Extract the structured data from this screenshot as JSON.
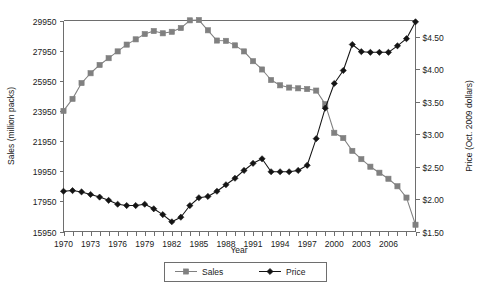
{
  "chart_data": {
    "type": "line",
    "title": "",
    "xlabel": "Year",
    "ylabel": "Sales (million packs)",
    "y2label": "Price (Oct. 2009 dollars)",
    "grid": false,
    "legend_position": "bottom-center",
    "xlim": [
      1970,
      2009
    ],
    "xticks": [
      1970,
      1973,
      1976,
      1979,
      1982,
      1985,
      1988,
      1991,
      1994,
      1997,
      2000,
      2003,
      2006
    ],
    "xtick_labels": [
      "1970",
      "1973",
      "1976",
      "1979",
      "1982",
      "1985",
      "1988",
      "1991",
      "1994",
      "1997",
      "2000",
      "2003",
      "2006"
    ],
    "x": [
      1970,
      1971,
      1972,
      1973,
      1974,
      1975,
      1976,
      1977,
      1978,
      1979,
      1980,
      1981,
      1982,
      1983,
      1984,
      1985,
      1986,
      1987,
      1988,
      1989,
      1990,
      1991,
      1992,
      1993,
      1994,
      1995,
      1996,
      1997,
      1998,
      1999,
      2000,
      2001,
      2002,
      2003,
      2004,
      2005,
      2006,
      2007,
      2008,
      2009
    ],
    "ylim": [
      15950,
      29950
    ],
    "yticks": [
      15950,
      17950,
      19950,
      21950,
      23950,
      25950,
      27950,
      29950
    ],
    "ytick_labels": [
      "15950",
      "17950",
      "19950",
      "21950",
      "23950",
      "25950",
      "27950",
      "29950"
    ],
    "y2lim": [
      1.5,
      4.75
    ],
    "y2ticks": [
      1.5,
      2.0,
      2.5,
      3.0,
      3.5,
      4.0,
      4.5
    ],
    "y2tick_labels": [
      "$1.50",
      "$2.00",
      "$2.50",
      "$3.00",
      "$3.50",
      "$4.00",
      "$4.50"
    ],
    "series": [
      {
        "name": "Sales",
        "axis": "left",
        "color": "#808080",
        "marker": "square",
        "values": [
          23950,
          24750,
          25800,
          26450,
          27000,
          27450,
          27900,
          28350,
          28700,
          29050,
          29250,
          29100,
          29200,
          29450,
          29960,
          29980,
          29300,
          28620,
          28600,
          28300,
          27900,
          27250,
          26700,
          26000,
          25650,
          25500,
          25450,
          25400,
          25300,
          24400,
          22500,
          22150,
          21300,
          20750,
          20250,
          19850,
          19450,
          18950,
          18200,
          16400
        ]
      },
      {
        "name": "Price",
        "axis": "right",
        "color": "#141414",
        "marker": "diamond",
        "values": [
          2.12,
          2.13,
          2.11,
          2.07,
          2.03,
          1.98,
          1.92,
          1.9,
          1.9,
          1.92,
          1.85,
          1.76,
          1.65,
          1.72,
          1.9,
          2.02,
          2.04,
          2.12,
          2.22,
          2.32,
          2.44,
          2.55,
          2.62,
          2.42,
          2.42,
          2.42,
          2.44,
          2.52,
          2.93,
          3.4,
          3.78,
          3.98,
          4.38,
          4.27,
          4.26,
          4.26,
          4.26,
          4.36,
          4.47,
          4.73
        ]
      }
    ]
  },
  "legend": {
    "items": [
      {
        "label": "Sales",
        "color": "#808080",
        "marker": "square"
      },
      {
        "label": "Price",
        "color": "#141414",
        "marker": "diamond"
      }
    ]
  }
}
